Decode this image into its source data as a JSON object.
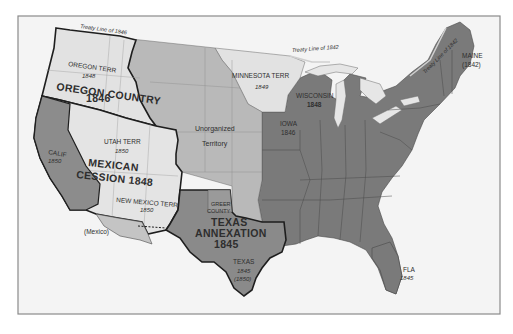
{
  "map": {
    "title": "United States territorial expansion 1845-1850",
    "colors": {
      "background": "#ffffff",
      "frame": "#8a8a8a",
      "ocean": "#f1f1f1",
      "states": "#7a7a7a",
      "state_borders": "#4a4a4a",
      "unorganized": "#b9b9b9",
      "territories_light": "#e2e2e2",
      "california": "#8c8c8c",
      "texas": "#8a8a8a",
      "mexico_gadsden": "#c4c4c4",
      "lakes": "#e6e6e6",
      "bold_border": "#1e1e1e"
    },
    "labels": {
      "treaty_1846": "Treaty Line of 1846",
      "treaty_1842_north": "Treaty Line of 1842",
      "treaty_1842_east": "Treaty Line of 1842",
      "oregon_terr": "OREGON TERR",
      "oregon_terr_year": "1848",
      "oregon_country": "OREGON COUNTRY",
      "oregon_country_year": "1846",
      "minnesota_terr": "MINNESOTA TERR",
      "minnesota_terr_year": "1849",
      "wisconsin": "WISCONSIN",
      "wisconsin_year": "1848",
      "iowa": "IOWA",
      "iowa_year": "1846",
      "maine": "MAINE",
      "maine_year": "(1842)",
      "unorganized_1": "Unorganized",
      "unorganized_2": "Territory",
      "utah_terr": "UTAH TERR",
      "utah_terr_year": "1850",
      "calif": "CALIF",
      "calif_year": "1850",
      "mexican_cession_1": "MEXICAN",
      "mexican_cession_2": "CESSION 1848",
      "new_mexico_terr": "NEW MEXICO TERR",
      "new_mexico_terr_year": "1850",
      "greer_county_1": "GREER",
      "greer_county_2": "COUNTY",
      "texas_annexation_1": "TEXAS",
      "texas_annexation_2": "ANNEXATION",
      "texas_annexation_3": "1845",
      "texas": "TEXAS",
      "texas_year": "1845",
      "texas_year_2": "(1850)",
      "mexico": "(Mexico)",
      "fla": "FLA",
      "fla_year": "1845"
    }
  }
}
